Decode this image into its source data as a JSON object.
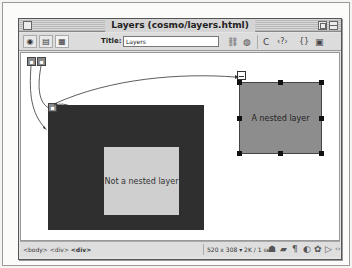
{
  "window": {
    "title": "Layers (cosmo/layers.html)"
  },
  "toolbar": {
    "view_buttons": [
      {
        "name": "code-view",
        "icon": "eye-icon",
        "glyph": "◉"
      },
      {
        "name": "split-view",
        "icon": "split-view-icon",
        "glyph": "▤"
      },
      {
        "name": "design-view",
        "icon": "design-view-icon",
        "glyph": "▦"
      }
    ],
    "title_label": "Title:",
    "title_value": "Layers",
    "icons": [
      {
        "name": "file-management-icon",
        "glyph": "⛓"
      },
      {
        "name": "preview-browser-icon",
        "glyph": "◍"
      },
      {
        "name": "refresh-icon",
        "glyph": "C"
      },
      {
        "name": "reference-icon",
        "glyph": "‹?›"
      },
      {
        "name": "code-navigation-icon",
        "glyph": "{}"
      },
      {
        "name": "view-options-icon",
        "glyph": "▣"
      }
    ]
  },
  "canvas": {
    "layer_markers": [
      "layer-marker-1",
      "layer-marker-2"
    ],
    "dark_layer": {
      "color": "#2f2f2f"
    },
    "inner_box_label": "Not a nested layer",
    "nested_layer_label": "A nested layer",
    "nested_layer_color": "#8d8d8d"
  },
  "statusbar": {
    "tag_selector": [
      "<body>",
      "<div>",
      "<div>"
    ],
    "window_size": "520 x 308",
    "download_stats": "2K / 1 sec",
    "launcher_icons": [
      {
        "name": "site-icon",
        "glyph": "☗"
      },
      {
        "name": "assets-icon",
        "glyph": "▰"
      },
      {
        "name": "html-styles-icon",
        "glyph": "¶"
      },
      {
        "name": "css-styles-icon",
        "glyph": "◐"
      },
      {
        "name": "behaviors-icon",
        "glyph": "✿"
      },
      {
        "name": "history-icon",
        "glyph": "▷"
      },
      {
        "name": "code-inspector-icon",
        "glyph": "‹›"
      }
    ]
  }
}
